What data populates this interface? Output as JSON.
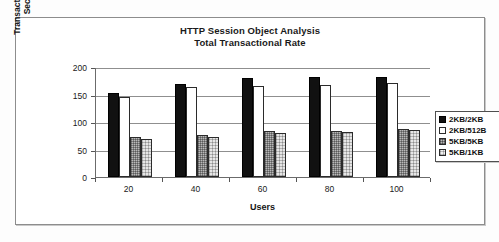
{
  "chart_data": {
    "type": "bar",
    "title": "HTTP Session Object Analysis",
    "subtitle": "Total Transactional Rate",
    "xlabel": "Users",
    "ylabel": "Transactrions per Second",
    "ylabel_line1": "Transactrions per",
    "ylabel_line2": "Second",
    "categories": [
      "20",
      "40",
      "60",
      "80",
      "100"
    ],
    "ylim": [
      0,
      200
    ],
    "yticks": [
      "0",
      "50",
      "100",
      "150",
      "200"
    ],
    "grid": true,
    "legend_position": "right",
    "series": [
      {
        "name": "2KB/2KB",
        "swatch": "black-solid",
        "values": [
          153,
          170,
          180,
          181,
          182
        ]
      },
      {
        "name": "2KB/512B",
        "swatch": "white-outline",
        "values": [
          145,
          164,
          165,
          168,
          171
        ]
      },
      {
        "name": "5KB/5KB",
        "swatch": "dark-hatch",
        "values": [
          72,
          76,
          83,
          84,
          88
        ]
      },
      {
        "name": "5KB/1KB",
        "swatch": "light-hatch",
        "values": [
          69,
          73,
          80,
          81,
          85
        ]
      }
    ]
  },
  "colors": {
    "series_2kb_2kb": "#111111",
    "series_2kb_512b": "#ffffff",
    "series_5kb_5kb": "#b9b9b9",
    "series_5kb_1kb": "#e6e6e6",
    "axis": "#6b6b6b",
    "gridline": "#8f8f8f",
    "frame": "#8d8d8d",
    "text": "#1a1a1a",
    "page": "#fdfdfd"
  }
}
